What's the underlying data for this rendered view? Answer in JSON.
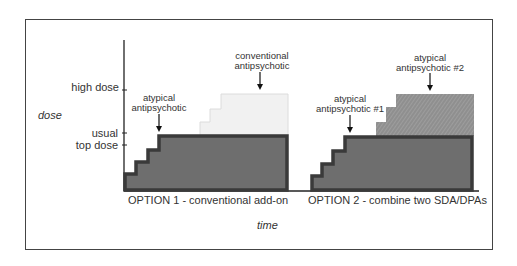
{
  "axes": {
    "y_label": "dose",
    "x_label": "time",
    "y_ticks": [
      "high dose",
      "usual",
      "top dose"
    ]
  },
  "option1": {
    "caption": "OPTION 1 - conventional add-on",
    "base_label_line1": "atypical",
    "base_label_line2": "antipsychotic",
    "addon_label_line1": "conventional",
    "addon_label_line2": "antipsychotic"
  },
  "option2": {
    "caption": "OPTION 2 - combine two SDA/DPAs",
    "base_label_line1": "atypical",
    "base_label_line2": "antipsychotic #1",
    "addon_label_line1": "atypical",
    "addon_label_line2": "antipsychotic #2"
  },
  "colors": {
    "base_fill": "#6e6e6e",
    "base_outline": "#3a3a3a",
    "conventional_fill": "#f0f0f0",
    "atypical2_fill": "#8e8e8e"
  }
}
